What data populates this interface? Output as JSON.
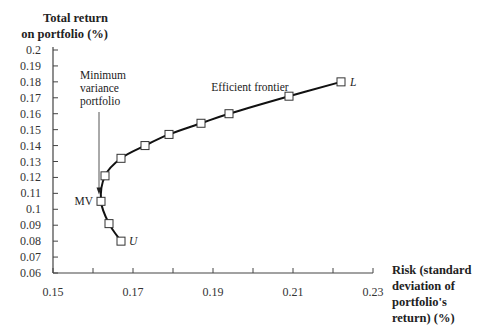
{
  "chart_data": {
    "type": "line",
    "title": "",
    "xlabel": "Risk (standard deviation of portfolio's return) (%)",
    "xlabel_lines": [
      "Risk (standard",
      "deviation of",
      "portfolio's",
      "return) (%)"
    ],
    "ylabel": "Total return on portfolio (%)",
    "ylabel_lines": [
      "Total return",
      "on portfolio (%)"
    ],
    "xlim": [
      0.15,
      0.23
    ],
    "ylim": [
      0.06,
      0.2
    ],
    "x_ticks": [
      0.15,
      0.16,
      0.17,
      0.18,
      0.19,
      0.2,
      0.21,
      0.22,
      0.23
    ],
    "x_tick_labels": [
      "0.15",
      "",
      "0.17",
      "",
      "0.19",
      "",
      "0.21",
      "",
      "0.23"
    ],
    "y_ticks": [
      0.2,
      0.19,
      0.18,
      0.17,
      0.16,
      0.15,
      0.14,
      0.13,
      0.12,
      0.11,
      0.1,
      0.09,
      0.08,
      0.07,
      0.06
    ],
    "y_tick_labels": [
      "0.2",
      "0.19",
      "0.18",
      "0.17",
      "0.16",
      "0.15",
      "0.14",
      "0.13",
      "0.12",
      "0.11",
      "0.1",
      "0.09",
      "0.08",
      "0.07",
      "0.06"
    ],
    "grid": false,
    "legend": null,
    "series": [
      {
        "name": "Efficient frontier",
        "marker": "open-square",
        "points": [
          {
            "x": 0.167,
            "y": 0.08,
            "label": "U"
          },
          {
            "x": 0.164,
            "y": 0.091
          },
          {
            "x": 0.162,
            "y": 0.105,
            "label": "MV"
          },
          {
            "x": 0.163,
            "y": 0.121
          },
          {
            "x": 0.167,
            "y": 0.132
          },
          {
            "x": 0.173,
            "y": 0.14
          },
          {
            "x": 0.179,
            "y": 0.147
          },
          {
            "x": 0.187,
            "y": 0.154
          },
          {
            "x": 0.194,
            "y": 0.16
          },
          {
            "x": 0.209,
            "y": 0.171
          },
          {
            "x": 0.222,
            "y": 0.18,
            "label": "L"
          }
        ]
      }
    ],
    "annotations": [
      {
        "text": "Efficient frontier",
        "x": 0.19,
        "y": 0.164
      },
      {
        "text": "Minimum variance portfolio",
        "lines": [
          "Minimum",
          "variance",
          "portfolio"
        ],
        "arrow_to": {
          "x": 0.162,
          "y": 0.108
        }
      },
      {
        "text": "MV",
        "point": "minimum variance"
      },
      {
        "text": "U",
        "italic": true
      },
      {
        "text": "L",
        "italic": true
      }
    ]
  }
}
